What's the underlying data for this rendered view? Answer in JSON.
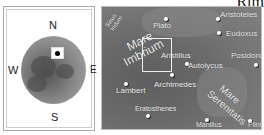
{
  "title": "Rim",
  "locator": {
    "compass": {
      "north": "N",
      "south": "S",
      "east": "E",
      "west": "W"
    }
  },
  "map": {
    "maria": [
      {
        "name_line1": "Mare",
        "name_line2": "Imbrium"
      },
      {
        "name_line1": "Mare",
        "name_line2": "Serenitatis"
      }
    ],
    "sinus": {
      "line1": "Sinus",
      "line2": "Iridum"
    },
    "craters": [
      "Plato",
      "Aristoteles",
      "Eudoxus",
      "Aristillus",
      "Autolycus",
      "Posidonius",
      "Archimedes",
      "Lambert",
      "Eratosthenes",
      "Manilius",
      "Plinius"
    ]
  }
}
